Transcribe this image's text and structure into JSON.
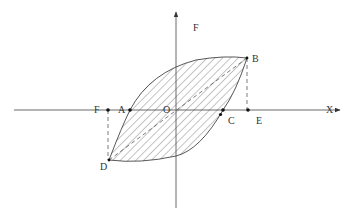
{
  "diagram": {
    "axes": {
      "horizontal_label": "X",
      "vertical_label": "F",
      "origin_label": "O"
    },
    "points": {
      "A": "A",
      "B": "B",
      "C": "C",
      "D": "D",
      "E": "E",
      "F": "F"
    },
    "fill_pattern": "diagonal-hatch",
    "colors": {
      "line": "#444444",
      "label": "#333333",
      "background": "#ffffff"
    }
  }
}
